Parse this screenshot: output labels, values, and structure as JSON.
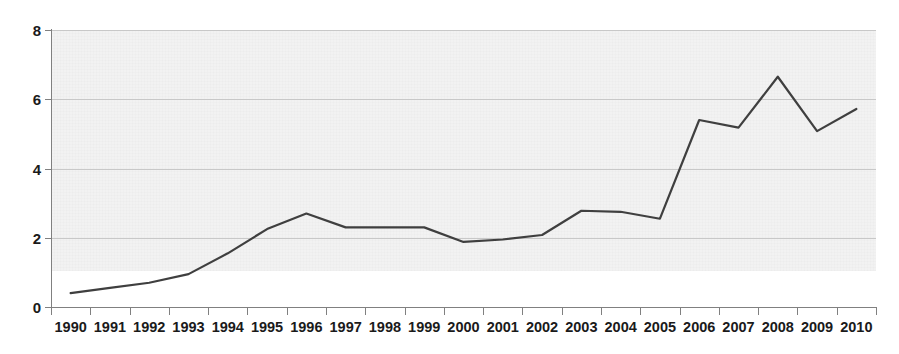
{
  "chart_data": {
    "type": "line",
    "title": "",
    "subtitle": "",
    "xlabel": "",
    "ylabel": "",
    "categories": [
      "1990",
      "1991",
      "1992",
      "1993",
      "1994",
      "1995",
      "1996",
      "1997",
      "1998",
      "1999",
      "2000",
      "2001",
      "2002",
      "2003",
      "2004",
      "2005",
      "2006",
      "2007",
      "2008",
      "2009",
      "2010"
    ],
    "values": [
      0.4,
      0.55,
      0.7,
      0.95,
      1.55,
      2.25,
      2.7,
      2.3,
      2.3,
      2.3,
      1.88,
      1.95,
      2.08,
      2.78,
      2.75,
      2.55,
      5.4,
      5.18,
      6.65,
      5.08,
      5.72
    ],
    "series": [
      {
        "name": "",
        "values": [
          0.4,
          0.55,
          0.7,
          0.95,
          1.55,
          2.25,
          2.7,
          2.3,
          2.3,
          2.3,
          1.88,
          1.95,
          2.08,
          2.78,
          2.75,
          2.55,
          5.4,
          5.18,
          6.65,
          5.08,
          5.72
        ]
      }
    ],
    "ylim": [
      0,
      8
    ],
    "yticks": [
      0,
      2,
      4,
      6,
      8
    ],
    "ytick_labels": [
      "0",
      "2",
      "4",
      "6",
      "8"
    ],
    "xtick_labels": [
      "1990",
      "1991",
      "1992",
      "1993",
      "1994",
      "1995",
      "1996",
      "1997",
      "1998",
      "1999",
      "2000",
      "2001",
      "2002",
      "2003",
      "2004",
      "2005",
      "2006",
      "2007",
      "2008",
      "2009",
      "2010"
    ],
    "grid": true,
    "grid_axis": "y",
    "legend": false,
    "legend_position": "none",
    "annotations": [],
    "colors": {
      "line": "#3f3f3f",
      "plot_band_background": "#f2f2f2",
      "gridline": "#c8c8c8",
      "axis": "#808080",
      "tick_label": "#1a1a1a",
      "page_background": "#ffffff"
    },
    "line_width": 2.2
  }
}
